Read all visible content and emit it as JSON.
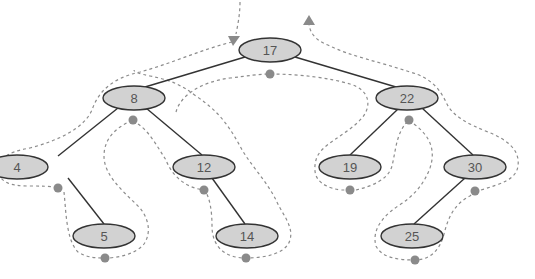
{
  "diagram": {
    "type": "binary-search-tree-euler-tour",
    "colors": {
      "node_fill": "#d2d2d2",
      "node_stroke": "#333333",
      "label": "#555555",
      "tour_line": "#8c8c8c",
      "visit_dot": "#8a8a8a"
    },
    "nodes": [
      {
        "id": "n17",
        "label": "17",
        "cx": 270,
        "cy": 50
      },
      {
        "id": "n8",
        "label": "8",
        "cx": 134,
        "cy": 98
      },
      {
        "id": "n22",
        "label": "22",
        "cx": 407,
        "cy": 98
      },
      {
        "id": "n4",
        "label": "4",
        "cx": 17,
        "cy": 167
      },
      {
        "id": "n12",
        "label": "12",
        "cx": 204,
        "cy": 167
      },
      {
        "id": "n19",
        "label": "19",
        "cx": 350,
        "cy": 167
      },
      {
        "id": "n30",
        "label": "30",
        "cx": 475,
        "cy": 167
      },
      {
        "id": "n5",
        "label": "5",
        "cx": 104,
        "cy": 236
      },
      {
        "id": "n14",
        "label": "14",
        "cx": 247,
        "cy": 236
      },
      {
        "id": "n25",
        "label": "25",
        "cx": 412,
        "cy": 236
      }
    ],
    "edges": [
      [
        "17",
        "8"
      ],
      [
        "17",
        "22"
      ],
      [
        "8",
        "4"
      ],
      [
        "8",
        "12"
      ],
      [
        "4",
        "5"
      ],
      [
        "12",
        "14"
      ],
      [
        "22",
        "19"
      ],
      [
        "22",
        "30"
      ],
      [
        "30",
        "25"
      ]
    ],
    "visit_dots": [
      {
        "node": "17",
        "x": 270,
        "y": 74
      },
      {
        "node": "8",
        "x": 133,
        "y": 120
      },
      {
        "node": "4",
        "x": 58,
        "y": 188
      },
      {
        "node": "5",
        "x": 105,
        "y": 258
      },
      {
        "node": "12",
        "x": 204,
        "y": 190
      },
      {
        "node": "14",
        "x": 246,
        "y": 258
      },
      {
        "node": "22",
        "x": 409,
        "y": 120
      },
      {
        "node": "19",
        "x": 350,
        "y": 190
      },
      {
        "node": "30",
        "x": 475,
        "y": 191
      },
      {
        "node": "25",
        "x": 415,
        "y": 260
      }
    ],
    "arrows": [
      {
        "name": "tour-start-arrow",
        "direction": "down"
      },
      {
        "name": "tour-end-arrow",
        "direction": "up"
      }
    ]
  }
}
